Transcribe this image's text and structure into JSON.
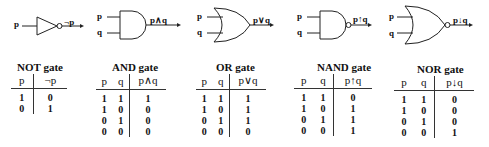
{
  "gates": [
    {
      "id": "not",
      "title": "NOT gate",
      "inputs": [
        "p"
      ],
      "output": "¬p",
      "headers": [
        "p",
        "¬p"
      ],
      "rows": [
        [
          "1",
          "0"
        ],
        [
          "0",
          "1"
        ]
      ]
    },
    {
      "id": "and",
      "title": "AND gate",
      "inputs": [
        "p",
        "q"
      ],
      "output": "p∧q",
      "headers": [
        "p",
        "q",
        "p∧q"
      ],
      "rows": [
        [
          "1",
          "1",
          "1"
        ],
        [
          "1",
          "0",
          "0"
        ],
        [
          "0",
          "1",
          "0"
        ],
        [
          "0",
          "0",
          "0"
        ]
      ]
    },
    {
      "id": "or",
      "title": "OR gate",
      "inputs": [
        "p",
        "q"
      ],
      "output": "p∨q",
      "headers": [
        "p",
        "q",
        "p∨q"
      ],
      "rows": [
        [
          "1",
          "1",
          "1"
        ],
        [
          "1",
          "0",
          "1"
        ],
        [
          "0",
          "1",
          "1"
        ],
        [
          "0",
          "0",
          "0"
        ]
      ]
    },
    {
      "id": "nand",
      "title": "NAND gate",
      "inputs": [
        "p",
        "q"
      ],
      "output": "p↑q",
      "headers": [
        "p",
        "q",
        "p↑q"
      ],
      "rows": [
        [
          "1",
          "1",
          "0"
        ],
        [
          "1",
          "0",
          "1"
        ],
        [
          "0",
          "1",
          "1"
        ],
        [
          "0",
          "0",
          "1"
        ]
      ]
    },
    {
      "id": "nor",
      "title": "NOR gate",
      "inputs": [
        "p",
        "q"
      ],
      "output": "p↓q",
      "headers": [
        "p",
        "q",
        "p↓q"
      ],
      "rows": [
        [
          "1",
          "1",
          "0"
        ],
        [
          "1",
          "0",
          "0"
        ],
        [
          "0",
          "1",
          "0"
        ],
        [
          "0",
          "0",
          "1"
        ]
      ]
    }
  ]
}
